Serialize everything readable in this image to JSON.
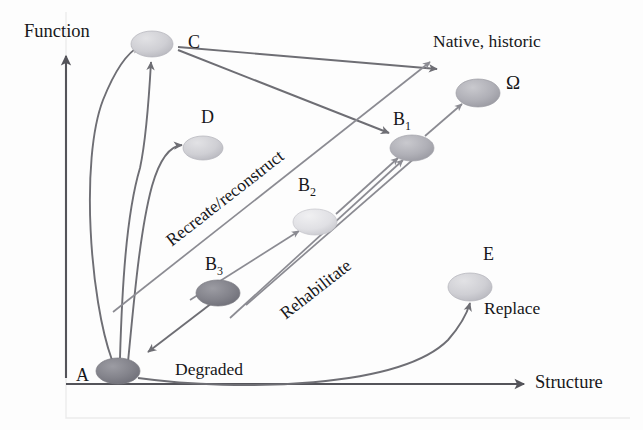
{
  "figure": {
    "kind": "state-transition-diagram",
    "background_color": "#fdfdfd",
    "ink_color": "#54545a"
  },
  "axes": {
    "y_label": "Function",
    "x_label": "Structure"
  },
  "state_labels": {
    "native_historic": "Native, historic",
    "degraded": "Degraded",
    "replace": "Replace"
  },
  "pathway_labels": {
    "recreate_reconstruct": "Recreate/reconstruct",
    "rehabilitate": "Rehabilitate"
  },
  "nodes": [
    {
      "id": "A",
      "label": "A",
      "sub": "",
      "cx": 118,
      "cy": 371,
      "rx": 22,
      "ry": 13,
      "shade": "dark"
    },
    {
      "id": "C",
      "label": "C",
      "sub": "",
      "cx": 152,
      "cy": 44,
      "rx": 21,
      "ry": 13,
      "shade": "light"
    },
    {
      "id": "D",
      "label": "D",
      "sub": "",
      "cx": 203,
      "cy": 148,
      "rx": 20,
      "ry": 12,
      "shade": "light"
    },
    {
      "id": "B3",
      "label": "B",
      "sub": "3",
      "cx": 218,
      "cy": 293,
      "rx": 22,
      "ry": 13,
      "shade": "dark"
    },
    {
      "id": "B2",
      "label": "B",
      "sub": "2",
      "cx": 315,
      "cy": 222,
      "rx": 22,
      "ry": 13,
      "shade": "pale"
    },
    {
      "id": "B1",
      "label": "B",
      "sub": "1",
      "cx": 412,
      "cy": 148,
      "rx": 22,
      "ry": 13,
      "shade": "mid"
    },
    {
      "id": "Om",
      "label": "Ω",
      "sub": "",
      "cx": 478,
      "cy": 93,
      "rx": 22,
      "ry": 14,
      "shade": "mid"
    },
    {
      "id": "E",
      "label": "E",
      "sub": "",
      "cx": 470,
      "cy": 287,
      "rx": 22,
      "ry": 14,
      "shade": "light"
    }
  ],
  "node_label_positions": [
    {
      "id": "A",
      "x": 76,
      "y": 366
    },
    {
      "id": "C",
      "x": 188,
      "y": 33
    },
    {
      "id": "D",
      "x": 201,
      "y": 108
    },
    {
      "id": "B3",
      "x": 205,
      "y": 255
    },
    {
      "id": "B2",
      "x": 298,
      "y": 176
    },
    {
      "id": "B1",
      "x": 393,
      "y": 110
    },
    {
      "id": "Om",
      "x": 506,
      "y": 73
    },
    {
      "id": "E",
      "x": 483,
      "y": 245
    }
  ],
  "transitions": [
    {
      "from": "A",
      "to": "C",
      "style": "curved"
    },
    {
      "from": "A",
      "to": "C",
      "style": "curved-inner"
    },
    {
      "from": "A",
      "to": "D",
      "style": "curved-branch"
    },
    {
      "from": "C",
      "to": "B1",
      "style": "straight"
    },
    {
      "from": "C",
      "to": "upper-right",
      "style": "straight"
    },
    {
      "from": "B3",
      "to": "B2",
      "style": "straight"
    },
    {
      "from": "B2",
      "to": "B1",
      "style": "straight"
    },
    {
      "from": "B3",
      "to": "A",
      "style": "straight"
    },
    {
      "from": "B1",
      "to": "Om",
      "style": "straight"
    },
    {
      "from": "A",
      "to": "E",
      "style": "curved"
    },
    {
      "from": "lower-left",
      "to": "upper-right",
      "style": "straight"
    }
  ]
}
